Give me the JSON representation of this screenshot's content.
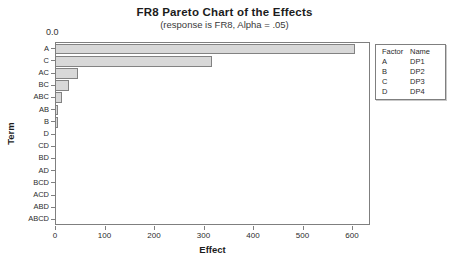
{
  "chart_data": {
    "type": "bar",
    "orientation": "horizontal",
    "title": "FR8 Pareto Chart of the Effects",
    "subtitle": "(response is FR8, Alpha = .05)",
    "xlabel": "Effect",
    "ylabel": "Term",
    "xlim": [
      0,
      636
    ],
    "x_ticks": [
      0,
      100,
      200,
      300,
      400,
      500,
      600
    ],
    "grid": false,
    "categories": [
      "A",
      "C",
      "AC",
      "BC",
      "ABC",
      "AB",
      "B",
      "D",
      "CD",
      "BD",
      "AD",
      "BCD",
      "ACD",
      "ABD",
      "ABCD"
    ],
    "values": [
      605,
      315,
      44,
      27,
      12,
      4.5,
      3.5,
      1.5,
      0.8,
      0.6,
      0.5,
      0.4,
      0.3,
      0.2,
      0.1
    ],
    "reference_line": {
      "label": "0.0",
      "value": 0.0
    },
    "legend": {
      "position": "right",
      "headers": [
        "Factor",
        "Name"
      ],
      "rows": [
        [
          "A",
          "DP1"
        ],
        [
          "B",
          "DP2"
        ],
        [
          "C",
          "DP3"
        ],
        [
          "D",
          "DP4"
        ]
      ]
    },
    "colors": {
      "bar_fill": "#d8d8d8",
      "bar_border": "#828282",
      "plot_border": "#7f7f7f",
      "text": "#2b2b2b"
    }
  }
}
